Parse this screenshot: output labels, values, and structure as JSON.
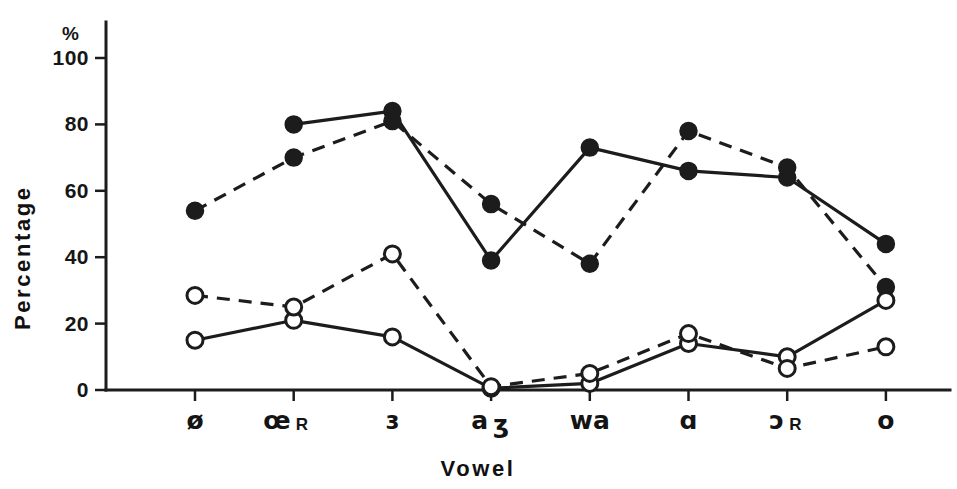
{
  "chart_data": {
    "type": "line",
    "title": "",
    "xlabel": "Vowel",
    "ylabel": "Percentage",
    "y_unit_label": "%",
    "categories": [
      "ø",
      "œʀ",
      "ɜ",
      "aʒ",
      "wa",
      "ɑ",
      "ɔʀ",
      "o"
    ],
    "category_main": [
      "ø",
      "œ",
      "ɜ",
      "a",
      "wa",
      "ɑ",
      "ɔ",
      "o"
    ],
    "category_sub": [
      "",
      "R",
      "",
      "ʒ",
      "",
      "",
      "R",
      ""
    ],
    "ylim": [
      0,
      100
    ],
    "yticks": [
      0,
      20,
      40,
      60,
      80,
      100
    ],
    "ytick_labels": [
      "0",
      "20",
      "40",
      "60",
      "80",
      "100"
    ],
    "grid": false,
    "legend": "none",
    "series": [
      {
        "name": "filled-solid",
        "marker": "filled-circle",
        "line": "solid",
        "values": [
          null,
          80,
          84,
          39,
          73,
          66,
          64,
          44
        ]
      },
      {
        "name": "filled-dashed",
        "marker": "filled-circle",
        "line": "dashed",
        "values": [
          54,
          70,
          81,
          56,
          38,
          78,
          67,
          31
        ]
      },
      {
        "name": "open-solid",
        "marker": "open-circle",
        "line": "solid",
        "values": [
          15,
          21,
          16,
          0.5,
          2,
          14,
          10,
          27
        ]
      },
      {
        "name": "open-dashed",
        "marker": "open-circle",
        "line": "dashed",
        "values": [
          28.5,
          25,
          41,
          1,
          5,
          17,
          6.5,
          13
        ]
      }
    ]
  },
  "colors": {
    "ink": "#1c1c1c",
    "background": "#ffffff"
  }
}
